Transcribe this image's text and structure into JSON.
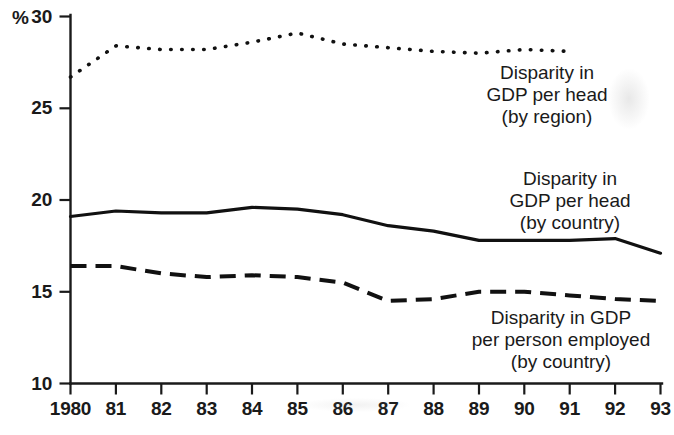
{
  "chart_data": {
    "type": "line",
    "title": "",
    "subtitle": "",
    "xlabel": "",
    "ylabel": "%",
    "y_unit_label": "%",
    "xlim": [
      1980,
      1993
    ],
    "ylim": [
      10,
      30
    ],
    "yticks": [
      10,
      15,
      20,
      25,
      30
    ],
    "ytick_labels": [
      "10",
      "15",
      "20",
      "25",
      "30"
    ],
    "x": [
      1980,
      1981,
      1982,
      1983,
      1984,
      1985,
      1986,
      1987,
      1988,
      1989,
      1990,
      1991,
      1992,
      1993
    ],
    "xtick_labels": [
      "1980",
      "81",
      "82",
      "83",
      "84",
      "85",
      "86",
      "87",
      "88",
      "89",
      "90",
      "91",
      "92",
      "93"
    ],
    "grid": false,
    "legend_position": "inline-annotations",
    "series": [
      {
        "name": "Disparity in GDP per head (by region)",
        "style": "dotted",
        "color": "#111111",
        "x": [
          1980,
          1981,
          1982,
          1983,
          1984,
          1985,
          1986,
          1987,
          1988,
          1989,
          1990,
          1991
        ],
        "values": [
          26.7,
          28.4,
          28.2,
          28.2,
          28.6,
          29.1,
          28.5,
          28.3,
          28.1,
          28.0,
          28.2,
          28.1
        ]
      },
      {
        "name": "Disparity in GDP per head (by country)",
        "style": "solid",
        "color": "#111111",
        "x": [
          1980,
          1981,
          1982,
          1983,
          1984,
          1985,
          1986,
          1987,
          1988,
          1989,
          1990,
          1991,
          1992,
          1993
        ],
        "values": [
          19.1,
          19.4,
          19.3,
          19.3,
          19.6,
          19.5,
          19.2,
          18.6,
          18.3,
          17.8,
          17.8,
          17.8,
          17.9,
          17.1
        ]
      },
      {
        "name": "Disparity in GDP per person employed (by country)",
        "style": "dashed",
        "color": "#111111",
        "x": [
          1980,
          1981,
          1982,
          1983,
          1984,
          1985,
          1986,
          1987,
          1988,
          1989,
          1990,
          1991,
          1992,
          1993
        ],
        "values": [
          16.4,
          16.4,
          16.0,
          15.8,
          15.9,
          15.8,
          15.5,
          14.5,
          14.6,
          15.0,
          15.0,
          14.8,
          14.6,
          14.5
        ]
      }
    ],
    "annotations": [
      {
        "id": "label-region",
        "lines": [
          "Disparity in",
          "GDP per head",
          "(by region)"
        ],
        "anchor_x": 547,
        "anchor_y": 62
      },
      {
        "id": "label-country-head",
        "lines": [
          "Disparity in",
          "GDP per head",
          "(by country)"
        ],
        "anchor_x": 570,
        "anchor_y": 168
      },
      {
        "id": "label-country-employed",
        "lines": [
          "Disparity in GDP",
          "per person employed",
          "(by country)"
        ],
        "anchor_x": 561,
        "anchor_y": 307
      }
    ]
  }
}
